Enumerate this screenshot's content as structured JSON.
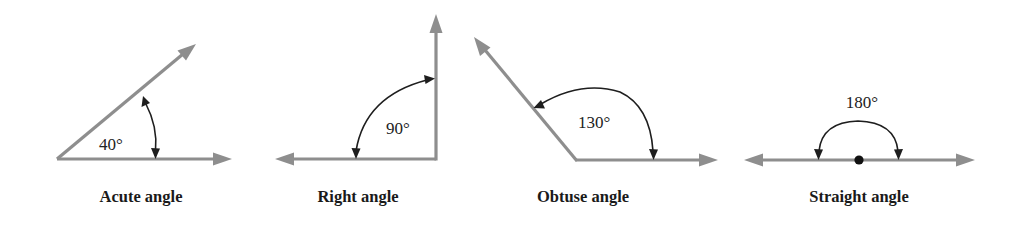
{
  "figure": {
    "angles": [
      {
        "id": "acute",
        "caption": "Acute angle",
        "measure": "40°",
        "degrees": 40
      },
      {
        "id": "right",
        "caption": "Right angle",
        "measure": "90°",
        "degrees": 90
      },
      {
        "id": "obtuse",
        "caption": "Obtuse angle",
        "measure": "130°",
        "degrees": 130
      },
      {
        "id": "straight",
        "caption": "Straight angle",
        "measure": "180°",
        "degrees": 180
      }
    ],
    "colors": {
      "ray": "#8e8e8e",
      "arc": "#1e1e1e",
      "text": "#1a1a1a",
      "background": "#ffffff"
    }
  }
}
